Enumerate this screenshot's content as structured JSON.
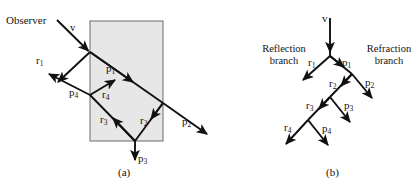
{
  "figure": {
    "panels": [
      {
        "id": "a",
        "caption": "(a)",
        "description": "Ray path through a transparent slab",
        "observer_label": "Observer",
        "labels": [
          {
            "name": "v",
            "text": "v"
          },
          {
            "name": "r1",
            "text": "r",
            "sub": "1"
          },
          {
            "name": "p1",
            "text": "p",
            "sub": "1"
          },
          {
            "name": "p2",
            "text": "p",
            "sub": "2"
          },
          {
            "name": "r2",
            "text": "r",
            "sub": "2"
          },
          {
            "name": "p3",
            "text": "p",
            "sub": "3"
          },
          {
            "name": "r3",
            "text": "r",
            "sub": "3"
          },
          {
            "name": "r4",
            "text": "r",
            "sub": "4"
          },
          {
            "name": "p4",
            "text": "p",
            "sub": "4"
          }
        ]
      },
      {
        "id": "b",
        "caption": "(b)",
        "description": "Ray tree with reflection and refraction branches",
        "branch_left_line1": "Reflection",
        "branch_left_line2": "branch",
        "branch_right_line1": "Refraction",
        "branch_right_line2": "branch",
        "labels": [
          {
            "name": "v",
            "text": "v"
          },
          {
            "name": "r1",
            "text": "r",
            "sub": "1"
          },
          {
            "name": "p1",
            "text": "p",
            "sub": "1"
          },
          {
            "name": "r2",
            "text": "r",
            "sub": "2"
          },
          {
            "name": "p2",
            "text": "p",
            "sub": "2"
          },
          {
            "name": "r3",
            "text": "r",
            "sub": "3"
          },
          {
            "name": "p3",
            "text": "p",
            "sub": "3"
          },
          {
            "name": "r4",
            "text": "r",
            "sub": "4"
          },
          {
            "name": "p4",
            "text": "p",
            "sub": "4"
          }
        ]
      }
    ],
    "colors": {
      "ray": "#111111",
      "slab_fill": "#e6e6e6",
      "slab_stroke": "#5a5a5a",
      "background": "#ffffff"
    }
  },
  "text": {
    "observer": "Observer",
    "v": "v",
    "r": "r",
    "p": "p",
    "s1": "1",
    "s2": "2",
    "s3": "3",
    "s4": "4",
    "reflection_1": "Reflection",
    "reflection_2": "branch",
    "refraction_1": "Refraction",
    "refraction_2": "branch",
    "caption_a": "(a)",
    "caption_b": "(b)"
  }
}
